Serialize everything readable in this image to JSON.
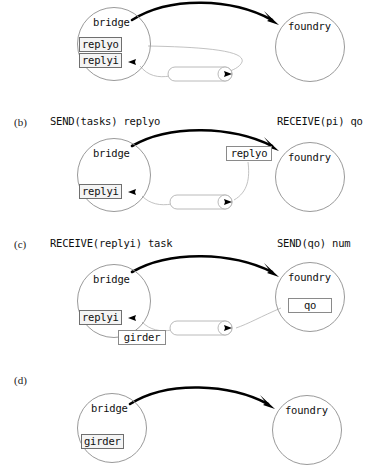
{
  "figure": {
    "type": "sequence-of-states-diagram",
    "nodes": {
      "left": "bridge",
      "right": "foundry"
    },
    "panels": [
      {
        "tag": "",
        "left_op": "",
        "right_op": "",
        "left_node": "bridge",
        "right_node": "foundry",
        "left_ports": [
          "replyo",
          "replyi"
        ],
        "right_ports": [],
        "floating_label": "",
        "channel_label": "",
        "has_channel": true,
        "has_message_arrow": true
      },
      {
        "tag": "(b)",
        "left_op": "SEND(tasks) replyo",
        "right_op": "RECEIVE(pi) qo",
        "left_node": "bridge",
        "right_node": "foundry",
        "left_ports": [
          "replyi"
        ],
        "right_ports": [],
        "floating_label": "replyo",
        "channel_label": "",
        "has_channel": true,
        "has_message_arrow": true
      },
      {
        "tag": "(c)",
        "left_op": "RECEIVE(replyi) task",
        "right_op": "SEND(qo) num",
        "left_node": "bridge",
        "right_node": "foundry",
        "left_ports": [
          "replyi"
        ],
        "right_ports": [
          "qo"
        ],
        "floating_label": "",
        "channel_label": "girder",
        "has_channel": true,
        "has_message_arrow": true
      },
      {
        "tag": "(d)",
        "left_op": "",
        "right_op": "",
        "left_node": "bridge",
        "right_node": "foundry",
        "left_ports": [
          "girder"
        ],
        "right_ports": [],
        "floating_label": "",
        "channel_label": "",
        "has_channel": false,
        "has_message_arrow": true
      }
    ]
  },
  "colors": {
    "node_stroke": "#9a9a9a",
    "thin_stroke": "#b3b3b3",
    "arrow": "#000000",
    "port_fill": "#f4f4f4",
    "text": "#101010"
  }
}
